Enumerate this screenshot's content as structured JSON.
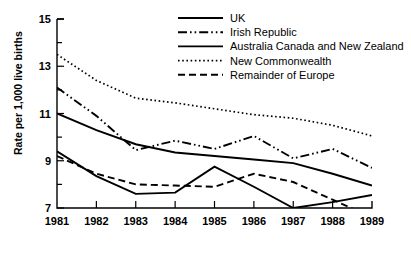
{
  "chart_data": {
    "type": "line",
    "title": "",
    "xlabel": "",
    "ylabel": "Rate per 1,000 live births",
    "x": [
      1981,
      1982,
      1983,
      1984,
      1985,
      1986,
      1987,
      1988,
      1989
    ],
    "xtick_labels": [
      "1981",
      "1982",
      "1983",
      "1984",
      "1985",
      "1986",
      "1987",
      "1988",
      "1989"
    ],
    "ytick_labels": [
      "7",
      "9",
      "11",
      "13",
      "15"
    ],
    "yticks": [
      7,
      9,
      11,
      13,
      15
    ],
    "ylim": [
      7,
      15
    ],
    "xlim": [
      1981,
      1989
    ],
    "grid": false,
    "minor_ticks": true,
    "legend_position": "top-right",
    "line_color": "#000000",
    "series": [
      {
        "name": "UK",
        "style": "solid",
        "values": [
          11.0,
          10.3,
          9.7,
          9.35,
          9.2,
          9.05,
          8.9,
          8.45,
          7.95
        ]
      },
      {
        "name": "Irish Republic",
        "style": "dash-dot-dot",
        "values": [
          12.1,
          10.9,
          9.45,
          9.85,
          9.5,
          10.05,
          9.1,
          9.5,
          8.7
        ]
      },
      {
        "name": "Australia Canada and New Zealand",
        "style": "solid",
        "values": [
          9.4,
          8.35,
          7.6,
          7.65,
          8.75,
          7.9,
          7.0,
          7.25,
          7.55
        ]
      },
      {
        "name": "New Commonwealth",
        "style": "dotted",
        "values": [
          13.5,
          12.4,
          11.65,
          11.45,
          11.2,
          10.95,
          10.8,
          10.5,
          10.05
        ]
      },
      {
        "name": "Remainder of Europe",
        "style": "dashed",
        "values": [
          9.2,
          8.45,
          8.0,
          7.95,
          7.9,
          8.45,
          8.1,
          7.35,
          6.6
        ]
      }
    ]
  },
  "legend": {
    "items": [
      {
        "label": "UK"
      },
      {
        "label": "Irish Republic"
      },
      {
        "label": "Australia Canada and New Zealand"
      },
      {
        "label": "New Commonwealth"
      },
      {
        "label": "Remainder of Europe"
      }
    ]
  },
  "axes": {
    "y_title": "Rate per 1,000 live births"
  }
}
